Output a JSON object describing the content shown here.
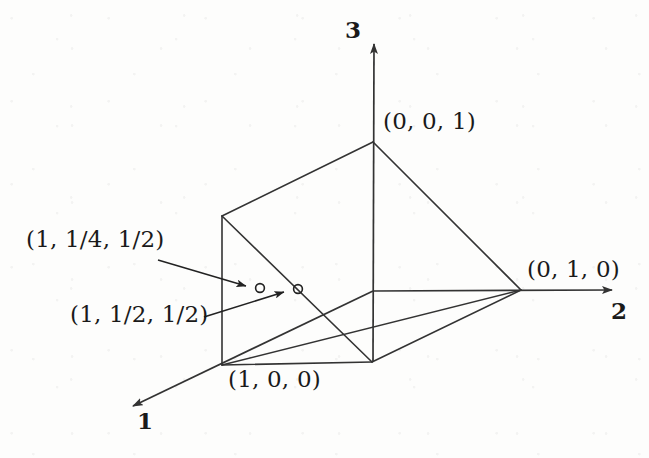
{
  "figure": {
    "type": "geometry-diagram-3d",
    "background_color": "#fdfdfc",
    "stroke_color": "#333333",
    "text_color": "#1a1a1a",
    "axes": [
      {
        "id": "axis-1",
        "name": "1",
        "label_x": 137,
        "label_y": 409,
        "direction": "down-left"
      },
      {
        "id": "axis-2",
        "name": "2",
        "label_x": 611,
        "label_y": 299,
        "direction": "right"
      },
      {
        "id": "axis-3",
        "name": "3",
        "label_x": 345,
        "label_y": 18,
        "direction": "up"
      }
    ],
    "vertex_labels": [
      {
        "id": "vertex-001",
        "text": "(0, 0, 1)",
        "label_x": 383,
        "label_y": 110
      },
      {
        "id": "vertex-010",
        "text": "(0, 1, 0)",
        "label_x": 527,
        "label_y": 258
      },
      {
        "id": "vertex-100",
        "text": "(1, 0, 0)",
        "label_x": 228,
        "label_y": 368
      }
    ],
    "point_labels": [
      {
        "id": "point-a",
        "text": "(1, 1/4, 1/2)",
        "label_x": 26,
        "label_y": 228
      },
      {
        "id": "point-b",
        "text": "(1, 1/2, 1/2)",
        "label_x": 70,
        "label_y": 303
      }
    ],
    "marked_points": [
      {
        "id": "marker-a",
        "cx": 260,
        "cy": 288,
        "r": 4.5
      },
      {
        "id": "marker-b",
        "cx": 298,
        "cy": 289,
        "r": 4.5
      }
    ],
    "leader_lines": [
      {
        "id": "leader-a",
        "from_x": 158,
        "from_y": 260,
        "to_x": 252,
        "to_y": 287
      },
      {
        "id": "leader-b",
        "from_x": 204,
        "from_y": 317,
        "to_x": 290,
        "to_y": 291
      }
    ],
    "geometry_points": {
      "origin": {
        "x": 373,
        "y": 291
      },
      "apex_001": {
        "x": 373,
        "y": 142
      },
      "vertex_010": {
        "x": 521,
        "y": 290
      },
      "vertex_100": {
        "x": 222,
        "y": 365
      },
      "upper_left": {
        "x": 222,
        "y": 216
      },
      "bottom_mid": {
        "x": 372,
        "y": 362
      },
      "axis1_tip": {
        "x": 124,
        "y": 412
      },
      "axis2_tip": {
        "x": 622,
        "y": 290
      },
      "axis3_tip": {
        "x": 374,
        "y": 34
      }
    }
  }
}
